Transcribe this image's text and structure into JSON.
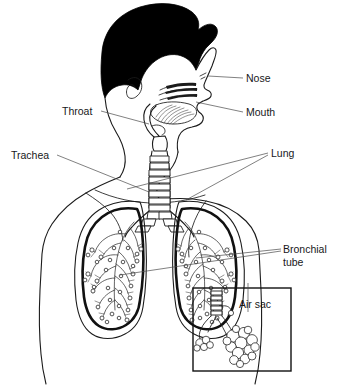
{
  "figure": {
    "kind": "anatomical-line-drawing",
    "background_color": "#ffffff",
    "line_color": "#1b1b1b",
    "leader_color": "#4a4a4a",
    "text_color": "#17181a"
  },
  "labels": {
    "nose": "Nose",
    "mouth": "Mouth",
    "throat": "Throat",
    "trachea": "Trachea",
    "lung": "Lung",
    "bronchial_line1": "Bronchial",
    "bronchial_line2": "tube",
    "air_sac": "Air sac"
  },
  "parts": [
    {
      "name": "nose",
      "label": "Nose",
      "side": "right",
      "label_x": 246,
      "label_y": 82
    },
    {
      "name": "mouth",
      "label": "Mouth",
      "side": "right",
      "label_x": 246,
      "label_y": 116
    },
    {
      "name": "throat",
      "label": "Throat",
      "side": "left",
      "label_x": 62,
      "label_y": 115
    },
    {
      "name": "trachea",
      "label": "Trachea",
      "side": "left",
      "label_x": 11,
      "label_y": 159
    },
    {
      "name": "lung",
      "label": "Lung",
      "side": "right",
      "label_x": 271,
      "label_y": 157
    },
    {
      "name": "bronchial-tube",
      "label": "Bronchial tube",
      "side": "right",
      "label_x": 283,
      "label_y": 253
    },
    {
      "name": "air-sac",
      "label": "Air sac",
      "side": "inset",
      "label_x": 239,
      "label_y": 308
    }
  ],
  "inset": {
    "name": "air-sac-magnifier",
    "x": 193,
    "y": 288,
    "width": 98,
    "height": 83,
    "contents": "magnified bronchiole with alveolar clusters"
  }
}
